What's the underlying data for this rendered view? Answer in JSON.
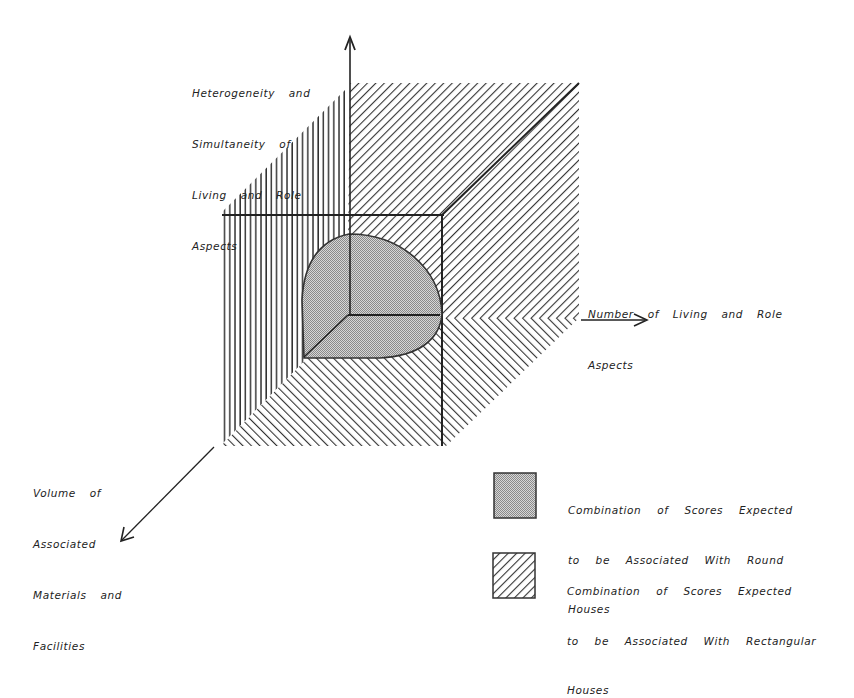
{
  "figure": {
    "type": "3d-axis-diagram",
    "axes": {
      "vertical": {
        "label_lines": [
          "Heterogeneity  and",
          "Simultaneity  of",
          "Living  and  Role",
          "Aspects"
        ]
      },
      "horizontal": {
        "label_lines": [
          "Number  of  Living  and  Role",
          "Aspects"
        ]
      },
      "depth": {
        "label_lines": [
          "Volume  of",
          "Associated",
          "Materials  and",
          "Facilities"
        ]
      }
    },
    "regions": {
      "round": {
        "description": "Shaded quarter-sphere region near origin",
        "fill": "#b8b8b8"
      },
      "rectangular": {
        "description": "Hatched planes of the cube",
        "stroke": "#333333"
      }
    },
    "legend": [
      {
        "swatch": "dotted-gray",
        "lines": [
          "Combination  of  Scores  Expected",
          "to  be  Associated  With  Round",
          "Houses"
        ]
      },
      {
        "swatch": "diagonal-hatch",
        "lines": [
          "Combination  of  Scores  Expected",
          "to  be  Associated  With  Rectangular",
          "Houses"
        ]
      }
    ]
  }
}
